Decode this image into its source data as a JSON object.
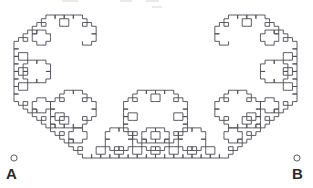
{
  "figure": {
    "background_color": "#ffffff",
    "stroke_color": "#4a4a52",
    "stroke_width": 0.9,
    "width": 313,
    "height": 188
  },
  "curve": {
    "type": "levy-c-curve",
    "iteration_depth": 10,
    "start": {
      "x": 14,
      "y": 158
    },
    "end": {
      "x": 297,
      "y": 158
    },
    "apex": {
      "x": 155.5,
      "y": 15
    },
    "turn_angle_degrees": 45,
    "scale_factor": 0.7071067811865476,
    "orientation": "upward",
    "symmetry": "mirror-vertical"
  },
  "endpoints": [
    {
      "id": "A",
      "label": "A",
      "marker": "open-circle",
      "marker_radius": 3.1,
      "x": 14,
      "y": 158,
      "label_x": 6,
      "label_y": 166
    },
    {
      "id": "B",
      "label": "B",
      "marker": "open-circle",
      "marker_radius": 3.1,
      "x": 297,
      "y": 158,
      "label_x": 292,
      "label_y": 166
    }
  ],
  "artifacts": {
    "top_cropped_text_remnants": [
      {
        "x": 62,
        "y": 0,
        "width": 16
      },
      {
        "x": 120,
        "y": 0,
        "width": 12
      },
      {
        "x": 146,
        "y": 0,
        "width": 13
      },
      {
        "x": 152,
        "y": 6,
        "width": 10
      }
    ]
  }
}
